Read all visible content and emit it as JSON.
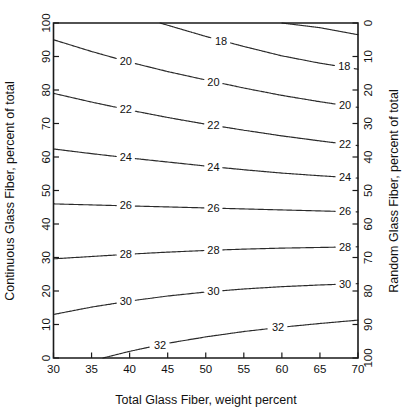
{
  "chart_data": {
    "type": "line",
    "subtype": "contour",
    "title": "",
    "xlabel": "Total Glass Fiber, weight percent",
    "ylabel": "Continuous Glass Fiber, percent of total",
    "y2label": "Random Glass Fiber, percent of total",
    "xlim": [
      30,
      70
    ],
    "ylim": [
      0,
      100
    ],
    "y2lim": [
      100,
      0
    ],
    "xticks": [
      30,
      35,
      40,
      45,
      50,
      55,
      60,
      65,
      70
    ],
    "xticklabels": [
      "30",
      "35",
      "40",
      "45",
      "50",
      "55",
      "60",
      "65",
      "70"
    ],
    "yticks": [
      0,
      10,
      20,
      30,
      40,
      50,
      60,
      70,
      80,
      90,
      100
    ],
    "yticklabels": [
      "0",
      "10",
      "20",
      "30",
      "40",
      "50",
      "60",
      "70",
      "80",
      "90",
      "100"
    ],
    "y2ticks": [
      0,
      10,
      20,
      30,
      40,
      50,
      60,
      70,
      80,
      90,
      100
    ],
    "y2ticklabels": [
      "0",
      "10",
      "20",
      "30",
      "40",
      "50",
      "60",
      "70",
      "80",
      "90",
      "100"
    ],
    "grid": false,
    "legend": false,
    "contour_levels": [
      16,
      18,
      20,
      22,
      24,
      26,
      28,
      30,
      32
    ],
    "contours": [
      {
        "level": 16,
        "label": "",
        "labeled": false,
        "points": [
          [
            60.0,
            100.0
          ],
          [
            65.0,
            98.6
          ],
          [
            70.0,
            96.5
          ]
        ],
        "label_positions": []
      },
      {
        "level": 18,
        "label": "18",
        "labeled": true,
        "points": [
          [
            44.0,
            100.0
          ],
          [
            47.0,
            98.0
          ],
          [
            50.0,
            96.0
          ],
          [
            55.0,
            93.0
          ],
          [
            60.0,
            90.2
          ],
          [
            65.0,
            88.0
          ],
          [
            70.0,
            86.2
          ]
        ],
        "label_positions": [
          [
            52.0,
            94.6
          ],
          [
            68.2,
            87.0
          ]
        ]
      },
      {
        "level": 20,
        "label": "20",
        "labeled": true,
        "points": [
          [
            30.0,
            95.0
          ],
          [
            35.0,
            91.5
          ],
          [
            40.0,
            88.3
          ],
          [
            45.0,
            85.5
          ],
          [
            50.0,
            83.0
          ],
          [
            55.0,
            80.6
          ],
          [
            60.0,
            78.4
          ],
          [
            65.0,
            76.5
          ],
          [
            70.0,
            74.8
          ]
        ],
        "label_positions": [
          [
            39.5,
            88.6
          ],
          [
            51.0,
            82.4
          ],
          [
            68.3,
            75.4
          ]
        ]
      },
      {
        "level": 22,
        "label": "22",
        "labeled": true,
        "points": [
          [
            30.0,
            79.0
          ],
          [
            35.0,
            76.4
          ],
          [
            40.0,
            74.0
          ],
          [
            45.0,
            71.8
          ],
          [
            50.0,
            69.8
          ],
          [
            55.0,
            68.0
          ],
          [
            60.0,
            66.3
          ],
          [
            65.0,
            64.8
          ],
          [
            70.0,
            63.4
          ]
        ],
        "label_positions": [
          [
            39.5,
            74.3
          ],
          [
            51.0,
            69.3
          ],
          [
            68.3,
            63.9
          ]
        ]
      },
      {
        "level": 24,
        "label": "24",
        "labeled": true,
        "points": [
          [
            30.0,
            62.4
          ],
          [
            35.0,
            61.0
          ],
          [
            40.0,
            59.7
          ],
          [
            45.0,
            58.5
          ],
          [
            50.0,
            57.3
          ],
          [
            55.0,
            56.2
          ],
          [
            60.0,
            55.2
          ],
          [
            65.0,
            54.4
          ],
          [
            70.0,
            53.7
          ]
        ],
        "label_positions": [
          [
            39.5,
            59.9
          ],
          [
            51.0,
            57.0
          ],
          [
            68.3,
            54.0
          ]
        ]
      },
      {
        "level": 26,
        "label": "26",
        "labeled": true,
        "points": [
          [
            30.0,
            46.0
          ],
          [
            35.0,
            45.7
          ],
          [
            40.0,
            45.4
          ],
          [
            45.0,
            45.1
          ],
          [
            50.0,
            44.8
          ],
          [
            55.0,
            44.5
          ],
          [
            60.0,
            44.2
          ],
          [
            65.0,
            43.9
          ],
          [
            70.0,
            43.6
          ]
        ],
        "label_positions": [
          [
            39.5,
            45.5
          ],
          [
            51.0,
            44.8
          ],
          [
            68.3,
            43.8
          ]
        ]
      },
      {
        "level": 28,
        "label": "28",
        "labeled": true,
        "points": [
          [
            30.0,
            29.6
          ],
          [
            35.0,
            30.3
          ],
          [
            40.0,
            31.0
          ],
          [
            45.0,
            31.6
          ],
          [
            50.0,
            32.1
          ],
          [
            55.0,
            32.5
          ],
          [
            60.0,
            32.8
          ],
          [
            65.0,
            33.0
          ],
          [
            70.0,
            33.2
          ]
        ],
        "label_positions": [
          [
            39.5,
            30.9
          ],
          [
            51.0,
            32.1
          ],
          [
            68.3,
            33.1
          ]
        ]
      },
      {
        "level": 30,
        "label": "30",
        "labeled": true,
        "points": [
          [
            30.0,
            13.0
          ],
          [
            35.0,
            15.2
          ],
          [
            40.0,
            17.0
          ],
          [
            45.0,
            18.5
          ],
          [
            50.0,
            19.7
          ],
          [
            55.0,
            20.6
          ],
          [
            60.0,
            21.3
          ],
          [
            65.0,
            21.8
          ],
          [
            70.0,
            22.2
          ]
        ],
        "label_positions": [
          [
            39.5,
            16.9
          ],
          [
            51.0,
            19.9
          ],
          [
            68.3,
            22.1
          ]
        ]
      },
      {
        "level": 32,
        "label": "32",
        "labeled": true,
        "points": [
          [
            36.5,
            0.0
          ],
          [
            40.0,
            2.0
          ],
          [
            45.0,
            4.4
          ],
          [
            50.0,
            6.3
          ],
          [
            55.0,
            7.9
          ],
          [
            60.0,
            9.2
          ],
          [
            65.0,
            10.3
          ],
          [
            70.0,
            11.3
          ]
        ],
        "label_positions": [
          [
            44.0,
            3.8
          ],
          [
            59.5,
            9.1
          ]
        ]
      }
    ]
  },
  "axes": {
    "x_title": "Total Glass Fiber, weight percent",
    "y_left_title": "Continuous Glass Fiber, percent of total",
    "y_right_title": "Random Glass Fiber, percent of total"
  },
  "colors": {
    "background": "#ffffff",
    "axis": "#1a1a1a",
    "contour": "#2b2b2b",
    "text": "#111111"
  }
}
